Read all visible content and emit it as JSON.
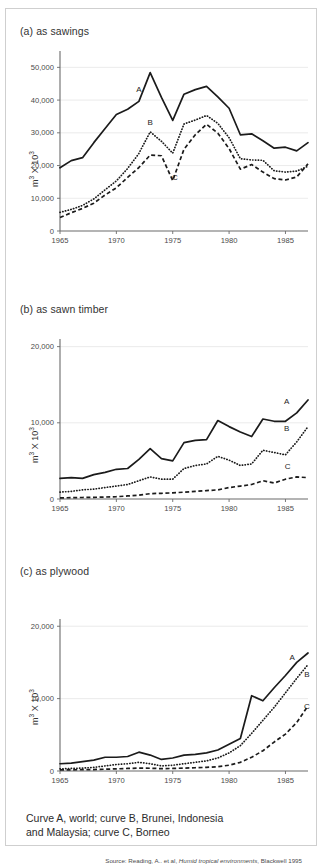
{
  "figure": {
    "caption_text": "Curve A, world; curve B, Brunei, Indonesia\nand Malaysia; curve C, Borneo",
    "source_prefix": "Source: Reading, A.. et al, ",
    "source_italic": "Humid tropical environments",
    "source_suffix": ", Blackwell 1995",
    "border_color": "#cfcfcf",
    "ink_color": "#1b1b1b",
    "grid_color": "#e2e2e2"
  },
  "panels": [
    {
      "id": "a",
      "title": "(a) as sawings"
    },
    {
      "id": "b",
      "title": "(b) as sawn timber"
    },
    {
      "id": "c",
      "title": "(c) as plywood"
    }
  ],
  "chart_data": [
    {
      "type": "line",
      "title": "(a) as sawings",
      "xlabel": "",
      "ylabel": "m³ X 10³",
      "xlim": [
        1965,
        1987
      ],
      "ylim": [
        0,
        55000
      ],
      "xticks": [
        1965,
        1970,
        1975,
        1980,
        1985
      ],
      "yticks": [
        0,
        10000,
        20000,
        30000,
        40000,
        50000
      ],
      "ytick_labels": [
        "0",
        "10,000",
        "20,000",
        "30,000",
        "40,000",
        "50,000"
      ],
      "grid": true,
      "legend_position": "inline-labels",
      "annotations": [
        {
          "text": "A",
          "x": 1972,
          "y": 42500
        },
        {
          "text": "B",
          "x": 1973,
          "y": 32500
        },
        {
          "text": "C",
          "x": 1975.2,
          "y": 15500
        }
      ],
      "x": [
        1965,
        1966,
        1967,
        1968,
        1969,
        1970,
        1971,
        1972,
        1973,
        1974,
        1975,
        1976,
        1977,
        1978,
        1979,
        1980,
        1981,
        1982,
        1983,
        1984,
        1985,
        1986,
        1987
      ],
      "series": [
        {
          "name": "A",
          "label": "Curve A, world",
          "values": [
            19300,
            21500,
            22400,
            27000,
            31300,
            35600,
            37200,
            39600,
            48400,
            40800,
            33800,
            41800,
            43200,
            44200,
            41000,
            37500,
            29400,
            29700,
            27600,
            25300,
            25600,
            24500,
            27000
          ]
        },
        {
          "name": "B",
          "label": "Curve B, Brunei, Indonesia and Malaysia",
          "values": [
            5700,
            6600,
            7800,
            9800,
            12600,
            15300,
            19100,
            23700,
            30300,
            27400,
            23800,
            32700,
            33900,
            35300,
            32900,
            28500,
            22100,
            21700,
            21600,
            18400,
            18000,
            18300,
            19800
          ]
        },
        {
          "name": "C",
          "label": "Curve C, Borneo",
          "values": [
            4100,
            5600,
            6900,
            8500,
            11000,
            13200,
            16400,
            19400,
            23200,
            23000,
            15400,
            25000,
            29400,
            32600,
            29900,
            25200,
            18900,
            20300,
            18000,
            16000,
            15600,
            16500,
            20500
          ]
        }
      ]
    },
    {
      "type": "line",
      "title": "(b) as sawn timber",
      "xlabel": "",
      "ylabel": "m³ X 10³",
      "xlim": [
        1965,
        1987
      ],
      "ylim": [
        0,
        21000
      ],
      "xticks": [
        1965,
        1970,
        1975,
        1980,
        1985
      ],
      "yticks": [
        0,
        10000,
        20000
      ],
      "ytick_labels": [
        "0",
        "10,000",
        "20,000"
      ],
      "grid": true,
      "legend_position": "inline-labels",
      "annotations": [
        {
          "text": "A",
          "x": 1985.1,
          "y": 12500
        },
        {
          "text": "B",
          "x": 1985.1,
          "y": 8900
        },
        {
          "text": "C",
          "x": 1985.2,
          "y": 3900
        }
      ],
      "x": [
        1965,
        1966,
        1967,
        1968,
        1969,
        1970,
        1971,
        1972,
        1973,
        1974,
        1975,
        1976,
        1977,
        1978,
        1979,
        1980,
        1981,
        1982,
        1983,
        1984,
        1985,
        1986,
        1987
      ],
      "series": [
        {
          "name": "A",
          "label": "Curve A, world",
          "values": [
            2700,
            2800,
            2700,
            3200,
            3500,
            3900,
            4000,
            5200,
            6600,
            5300,
            5000,
            7400,
            7700,
            7800,
            10300,
            9500,
            8800,
            8200,
            10500,
            10200,
            10200,
            11300,
            13000
          ]
        },
        {
          "name": "B",
          "label": "Curve B, Brunei, Indonesia and Malaysia",
          "values": [
            900,
            1000,
            1200,
            1300,
            1500,
            1700,
            1900,
            2400,
            2900,
            2600,
            2600,
            4000,
            4400,
            4600,
            5600,
            5100,
            4400,
            4600,
            6400,
            6100,
            5800,
            7500,
            9500
          ]
        },
        {
          "name": "C",
          "label": "Curve C, Borneo",
          "values": [
            150,
            180,
            200,
            220,
            260,
            300,
            400,
            500,
            700,
            750,
            800,
            900,
            1000,
            1100,
            1200,
            1500,
            1700,
            1900,
            2400,
            2100,
            2600,
            2900,
            2800
          ]
        }
      ]
    },
    {
      "type": "line",
      "title": "(c) as plywood",
      "xlabel": "",
      "ylabel": "m³ X 10³",
      "xlim": [
        1965,
        1987
      ],
      "ylim": [
        0,
        21000
      ],
      "xticks": [
        1965,
        1970,
        1975,
        1980,
        1985
      ],
      "yticks": [
        0,
        10000,
        20000
      ],
      "ytick_labels": [
        "0",
        "10,000",
        "20,000"
      ],
      "grid": true,
      "legend_position": "inline-labels",
      "annotations": [
        {
          "text": "A",
          "x": 1985.6,
          "y": 15400
        },
        {
          "text": "B",
          "x": 1986.9,
          "y": 13000
        },
        {
          "text": "C",
          "x": 1986.9,
          "y": 8600
        }
      ],
      "x": [
        1965,
        1966,
        1967,
        1968,
        1969,
        1970,
        1971,
        1972,
        1973,
        1974,
        1975,
        1976,
        1977,
        1978,
        1979,
        1980,
        1981,
        1982,
        1983,
        1984,
        1985,
        1986,
        1987
      ],
      "series": [
        {
          "name": "A",
          "label": "Curve A, world",
          "values": [
            1000,
            1100,
            1300,
            1500,
            1900,
            1900,
            2000,
            2600,
            2200,
            1600,
            1800,
            2200,
            2300,
            2500,
            2900,
            3700,
            4500,
            10400,
            9700,
            11500,
            13200,
            15000,
            16300
          ]
        },
        {
          "name": "B",
          "label": "Curve B, Brunei, Indonesia and Malaysia",
          "values": [
            300,
            350,
            400,
            500,
            700,
            900,
            1000,
            1200,
            1000,
            700,
            800,
            1000,
            1200,
            1400,
            1800,
            2500,
            3500,
            5200,
            7000,
            8800,
            10800,
            12800,
            14700
          ]
        },
        {
          "name": "C",
          "label": "Curve C, Borneo",
          "values": [
            150,
            160,
            180,
            200,
            250,
            300,
            350,
            400,
            380,
            330,
            350,
            400,
            450,
            500,
            600,
            800,
            1200,
            1900,
            2800,
            4000,
            5100,
            6700,
            9000
          ]
        }
      ]
    }
  ]
}
